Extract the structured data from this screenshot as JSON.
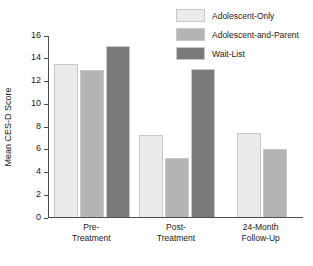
{
  "chart_data": {
    "type": "bar",
    "title": "",
    "xlabel": "",
    "ylabel": "Mean CES-D Score",
    "ylim": [
      0,
      16
    ],
    "yticks": [
      0,
      2,
      4,
      6,
      8,
      10,
      12,
      14,
      16
    ],
    "grid": false,
    "legend_position": "top-right",
    "categories": [
      "Pre-Treatment",
      "Post-Treatment",
      "24-Month Follow-Up"
    ],
    "category_lines": [
      [
        "Pre-",
        "Treatment"
      ],
      [
        "Post-",
        "Treatment"
      ],
      [
        "24-Month",
        "Follow-Up"
      ]
    ],
    "series": [
      {
        "name": "Adolescent-Only",
        "color": "#ebebeb",
        "values": [
          13.4,
          7.2,
          7.3
        ]
      },
      {
        "name": "Adolescent-and-Parent",
        "color": "#b4b4b4",
        "values": [
          12.9,
          5.1,
          5.9
        ]
      },
      {
        "name": "Wait-List",
        "color": "#7a7a7a",
        "values": [
          15.0,
          13.0,
          null
        ]
      }
    ]
  },
  "axis": {
    "tick_labels": [
      "0",
      "2",
      "4",
      "6",
      "8",
      "10",
      "12",
      "14",
      "16"
    ],
    "y_title": "Mean CES-D Score"
  },
  "legend": {
    "items": [
      {
        "label": "Adolescent-Only",
        "color": "#ebebeb"
      },
      {
        "label": "Adolescent-and-Parent",
        "color": "#b4b4b4"
      },
      {
        "label": "Wait-List",
        "color": "#7a7a7a"
      }
    ]
  },
  "colors": {
    "axis": "#4d4d4d",
    "text": "#1a1a1a",
    "background": "#ffffff",
    "bar_border": "#c8c8c8"
  }
}
